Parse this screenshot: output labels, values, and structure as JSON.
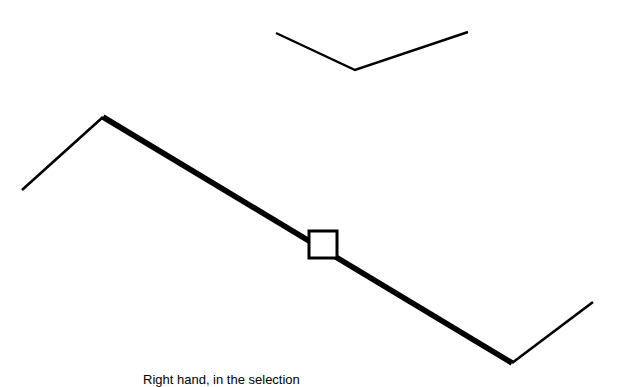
{
  "canvas": {
    "width": 623,
    "height": 387,
    "background_color": "#ffffff",
    "stroke_color": "#000000"
  },
  "caption": {
    "text": "Right hand, in the selection",
    "clipped": true
  },
  "shapes": {
    "upper_chevron": {
      "name": "upper-chevron-polyline",
      "stroke_width": 2.4,
      "points": "276,33 355,70 468,32",
      "vertices": [
        {
          "x": 276,
          "y": 33
        },
        {
          "x": 355,
          "y": 70
        },
        {
          "x": 468,
          "y": 32
        }
      ]
    },
    "main_polyline_thin_left": {
      "name": "main-polyline-left-thin-segment",
      "stroke_width": 2.6,
      "points": "22,190 103,117",
      "vertices": [
        {
          "x": 22,
          "y": 190
        },
        {
          "x": 103,
          "y": 117
        }
      ]
    },
    "main_polyline_thick": {
      "name": "main-polyline-thick-segment",
      "stroke_width": 5.6,
      "points": "103,117 512,363",
      "vertices": [
        {
          "x": 103,
          "y": 117
        },
        {
          "x": 512,
          "y": 363
        }
      ]
    },
    "main_polyline_thin_right": {
      "name": "main-polyline-right-thin-segment",
      "stroke_width": 2.6,
      "points": "512,363 593,302",
      "vertices": [
        {
          "x": 512,
          "y": 363
        },
        {
          "x": 593,
          "y": 302
        }
      ]
    },
    "selection_handle": {
      "name": "selection-handle-square",
      "x": 309,
      "y": 231,
      "width": 28,
      "height": 27,
      "stroke_width": 3,
      "fill": "none"
    }
  }
}
